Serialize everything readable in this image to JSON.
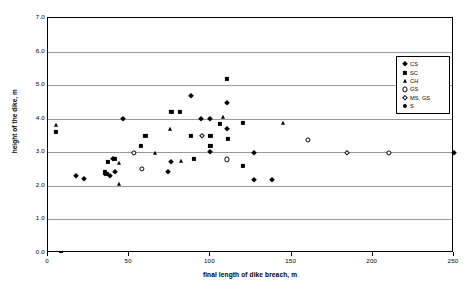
{
  "chart_data": {
    "type": "scatter",
    "title": "Relationship of height of the dike vs final length of breach in case of different soiltypes",
    "title_line1": "Relationship of height of the dike vs final length of",
    "title_line2": "breach in case of different soiltypes",
    "subtitle": "(49 data)",
    "xlabel": "final length of dike breach, m",
    "ylabel": "height of the dike, m",
    "xlim": [
      0,
      250
    ],
    "ylim": [
      0,
      7
    ],
    "xticks": [
      0,
      50,
      100,
      150,
      200,
      250
    ],
    "xtick_labels": [
      "0",
      "50",
      "100",
      "150",
      "200",
      "250"
    ],
    "yticks": [
      0.0,
      1.0,
      2.0,
      3.0,
      4.0,
      5.0,
      6.0,
      7.0
    ],
    "ytick_labels": [
      "0.0",
      "1.0",
      "2.0",
      "3.0",
      "4.0",
      "5.0",
      "6.0",
      "7.0"
    ],
    "grid": "horizontal",
    "legend_position": "top-right-inside",
    "series": [
      {
        "name": "CS",
        "marker": "diamond-filled",
        "points": [
          [
            17,
            2.3
          ],
          [
            22,
            2.2
          ],
          [
            38,
            2.3
          ],
          [
            40,
            2.8
          ],
          [
            41,
            2.4
          ],
          [
            46,
            4.0
          ],
          [
            74,
            2.4
          ],
          [
            76,
            2.7
          ],
          [
            88,
            4.68
          ],
          [
            94,
            4.0
          ],
          [
            100,
            4.0
          ],
          [
            100,
            3.0
          ],
          [
            110,
            4.47
          ],
          [
            110,
            3.7
          ],
          [
            127,
            2.99
          ],
          [
            127,
            2.18
          ],
          [
            138,
            2.18
          ],
          [
            250,
            2.97
          ]
        ]
      },
      {
        "name": "SC",
        "marker": "square-filled",
        "points": [
          [
            5,
            3.6
          ],
          [
            35,
            2.4
          ],
          [
            36,
            2.35
          ],
          [
            37,
            2.72
          ],
          [
            41,
            2.8
          ],
          [
            57,
            3.2
          ],
          [
            60,
            3.5
          ],
          [
            76,
            4.2
          ],
          [
            81,
            4.2
          ],
          [
            88,
            3.5
          ],
          [
            90,
            2.8
          ],
          [
            100,
            3.5
          ],
          [
            100,
            3.2
          ],
          [
            106,
            3.85
          ],
          [
            110,
            5.18
          ],
          [
            111,
            3.4
          ],
          [
            120,
            3.88
          ],
          [
            120,
            2.6
          ]
        ]
      },
      {
        "name": "CH",
        "marker": "triangle-filled",
        "points": [
          [
            5,
            3.8
          ],
          [
            44,
            2.07
          ],
          [
            44,
            2.67
          ],
          [
            66,
            2.99
          ],
          [
            75,
            3.7
          ],
          [
            82,
            2.75
          ],
          [
            108,
            4.05
          ],
          [
            145,
            3.87
          ]
        ]
      },
      {
        "name": "GS",
        "marker": "circle-open",
        "points": [
          [
            53,
            2.99
          ],
          [
            58,
            2.5
          ],
          [
            110,
            2.79
          ],
          [
            160,
            3.38
          ],
          [
            210,
            2.97
          ]
        ]
      },
      {
        "name": "MS, GS",
        "marker": "diamond-open",
        "points": [
          [
            95,
            3.5
          ],
          [
            184,
            2.97
          ]
        ]
      },
      {
        "name": "S",
        "marker": "circle-filled",
        "points": []
      }
    ]
  },
  "legend": {
    "entries": [
      {
        "label": "CS",
        "marker": "diamond-filled"
      },
      {
        "label": "SC",
        "marker": "square-filled"
      },
      {
        "label": "CH",
        "marker": "triangle-filled"
      },
      {
        "label": "GS",
        "marker": "circle-open"
      },
      {
        "label": "MS, GS",
        "marker": "diamond-open"
      },
      {
        "label": "S",
        "marker": "circle-filled"
      }
    ]
  },
  "colors": {
    "marker": "#000000",
    "gridline": "#9a9a9a",
    "axis": "#000000",
    "background": "#ffffff"
  }
}
